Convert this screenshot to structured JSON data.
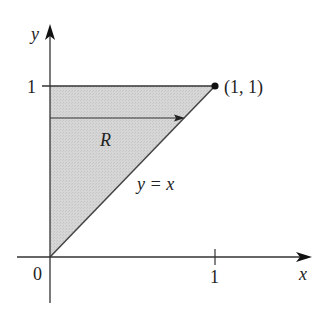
{
  "diagram": {
    "type": "region-plot",
    "axes": {
      "x_label": "x",
      "y_label": "y",
      "origin_label": "0",
      "x_tick_label": "1",
      "y_tick_label": "1"
    },
    "region": {
      "label": "R",
      "fill": "#d4d4d4",
      "vertices": [
        [
          0,
          0
        ],
        [
          0,
          1
        ],
        [
          1,
          1
        ]
      ]
    },
    "curve": {
      "label": "y = x",
      "equation": "y = x"
    },
    "point": {
      "label": "(1, 1)",
      "x": 1,
      "y": 1
    },
    "arrow": {
      "description": "horizontal arrow across region R from y-axis to line y = x"
    }
  }
}
